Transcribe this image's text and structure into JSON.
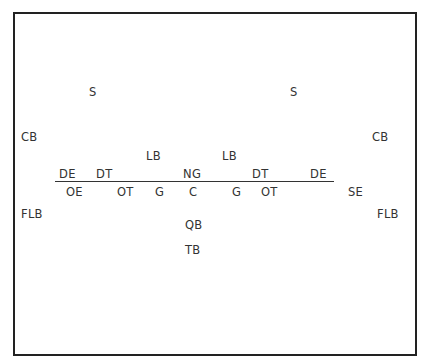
{
  "diagram": {
    "type": "football-formation",
    "colors": {
      "border": "#222222",
      "text": "#333333",
      "line": "#333333",
      "background": "#ffffff"
    },
    "defense": {
      "safeties": [
        {
          "label": "S",
          "x": 89,
          "y": 86
        },
        {
          "label": "S",
          "x": 290,
          "y": 86
        }
      ],
      "cornerbacks": [
        {
          "label": "CB",
          "x": 21,
          "y": 131
        },
        {
          "label": "CB",
          "x": 372,
          "y": 131
        }
      ],
      "linebackers": [
        {
          "label": "LB",
          "x": 146,
          "y": 150
        },
        {
          "label": "LB",
          "x": 222,
          "y": 150
        }
      ],
      "line": [
        {
          "label": "DE",
          "x": 59,
          "y": 168
        },
        {
          "label": "DT",
          "x": 96,
          "y": 168
        },
        {
          "label": "NG",
          "x": 183,
          "y": 168
        },
        {
          "label": "DT",
          "x": 252,
          "y": 168
        },
        {
          "label": "DE",
          "x": 310,
          "y": 168
        }
      ]
    },
    "offense": {
      "line": [
        {
          "label": "OE",
          "x": 66,
          "y": 186
        },
        {
          "label": "OT",
          "x": 117,
          "y": 186
        },
        {
          "label": "G",
          "x": 155,
          "y": 186
        },
        {
          "label": "C",
          "x": 189,
          "y": 186
        },
        {
          "label": "G",
          "x": 232,
          "y": 186
        },
        {
          "label": "OT",
          "x": 261,
          "y": 186
        }
      ],
      "split_end": {
        "label": "SE",
        "x": 348,
        "y": 186
      },
      "flankers": [
        {
          "label": "FLB",
          "x": 21,
          "y": 208
        },
        {
          "label": "FLB",
          "x": 377,
          "y": 208
        }
      ],
      "quarterback": {
        "label": "QB",
        "x": 185,
        "y": 219
      },
      "tailback": {
        "label": "TB",
        "x": 185,
        "y": 244
      }
    }
  }
}
